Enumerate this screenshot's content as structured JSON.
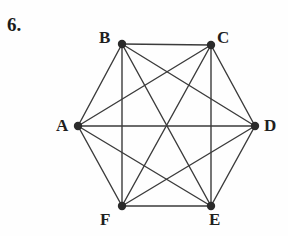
{
  "figure": {
    "problem_number": "6.",
    "caption": "",
    "background_color": "#fefefe",
    "edge_color": "#3b3b3b",
    "vertex_color": "#2b2b2b",
    "label_color": "#1f1f1f",
    "edge_width": 1.4,
    "vertex_radius": 4.2,
    "graph_type": "complete-graph-K6",
    "vertex_count": 6,
    "edge_count": 15
  },
  "chart_data": {
    "type": "diagram",
    "title": "",
    "xlabel": "",
    "ylabel": "",
    "nodes": [
      {
        "id": "A",
        "label": "A",
        "x": 78,
        "y": 126,
        "label_x": 56,
        "label_y": 117
      },
      {
        "id": "B",
        "label": "B",
        "x": 122,
        "y": 44,
        "label_x": 99,
        "label_y": 29
      },
      {
        "id": "C",
        "label": "C",
        "x": 211,
        "y": 45,
        "label_x": 217,
        "label_y": 29
      },
      {
        "id": "D",
        "label": "D",
        "x": 255,
        "y": 126,
        "label_x": 264,
        "label_y": 117
      },
      {
        "id": "E",
        "label": "E",
        "x": 211,
        "y": 206,
        "label_x": 209,
        "label_y": 211
      },
      {
        "id": "F",
        "label": "F",
        "x": 122,
        "y": 206,
        "label_x": 100,
        "label_y": 211
      }
    ],
    "edges": [
      {
        "from": "A",
        "to": "B"
      },
      {
        "from": "A",
        "to": "C"
      },
      {
        "from": "A",
        "to": "D"
      },
      {
        "from": "A",
        "to": "E"
      },
      {
        "from": "A",
        "to": "F"
      },
      {
        "from": "B",
        "to": "C"
      },
      {
        "from": "B",
        "to": "D"
      },
      {
        "from": "B",
        "to": "E"
      },
      {
        "from": "B",
        "to": "F"
      },
      {
        "from": "C",
        "to": "D"
      },
      {
        "from": "C",
        "to": "E"
      },
      {
        "from": "C",
        "to": "F"
      },
      {
        "from": "D",
        "to": "E"
      },
      {
        "from": "D",
        "to": "F"
      },
      {
        "from": "E",
        "to": "F"
      }
    ]
  }
}
